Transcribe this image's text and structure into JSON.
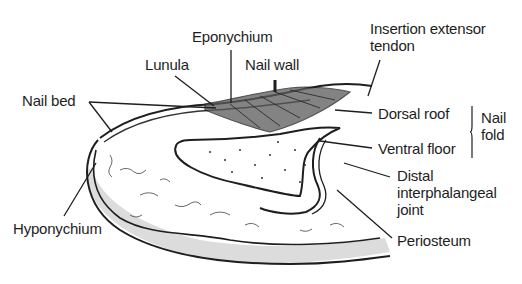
{
  "diagram": {
    "labels": {
      "eponychium": "Eponychium",
      "insertion_line1": "Insertion extensor",
      "insertion_line2": "tendon",
      "lunula": "Lunula",
      "nail_wall": "Nail wall",
      "nail_bed": "Nail bed",
      "dorsal_roof": "Dorsal roof",
      "ventral_floor": "Ventral floor",
      "nail_fold_line1": "Nail",
      "nail_fold_line2": "fold",
      "dip_line1": "Distal",
      "dip_line2": "interphalangeal",
      "dip_line3": "joint",
      "hyponychium": "Hyponychium",
      "periosteum": "Periosteum"
    },
    "colors": {
      "ink": "#1e1e1e",
      "shade": "#d8d8d8",
      "background": "#ffffff"
    }
  }
}
